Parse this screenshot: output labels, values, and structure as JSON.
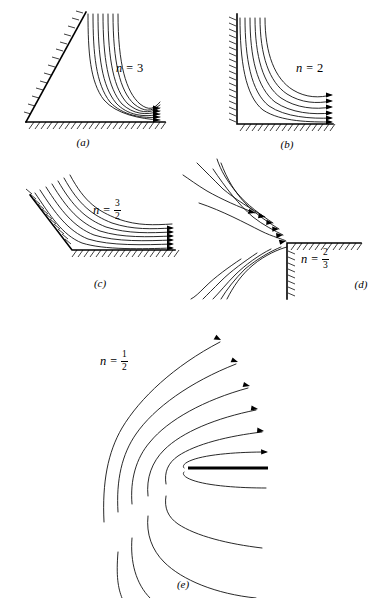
{
  "figure": {
    "background_color": "#ffffff",
    "ink_color": "#000000",
    "panels": [
      {
        "id": "a",
        "caption": "(a)",
        "label": {
          "variable": "n",
          "equals": "=",
          "value": "3",
          "is_fraction": false,
          "numerator": "",
          "denominator": ""
        },
        "wall_type": "acute-wedge",
        "corner_angle_deg": 60,
        "streamline_count": 7,
        "arrow_count": 5,
        "flow_direction": "right"
      },
      {
        "id": "b",
        "caption": "(b)",
        "label": {
          "variable": "n",
          "equals": "=",
          "value": "2",
          "is_fraction": false,
          "numerator": "",
          "denominator": ""
        },
        "wall_type": "right-angle-corner",
        "corner_angle_deg": 90,
        "streamline_count": 6,
        "arrow_count": 6,
        "flow_direction": "right"
      },
      {
        "id": "c",
        "caption": "(c)",
        "label": {
          "variable": "n",
          "equals": "=",
          "value": "",
          "is_fraction": true,
          "numerator": "3",
          "denominator": "2"
        },
        "wall_type": "obtuse-corner",
        "corner_angle_deg": 120,
        "streamline_count": 7,
        "arrow_count": 6,
        "flow_direction": "right"
      },
      {
        "id": "d",
        "caption": "(d)",
        "label": {
          "variable": "n",
          "equals": "=",
          "value": "",
          "is_fraction": true,
          "numerator": "2",
          "denominator": "3"
        },
        "wall_type": "exterior-corner",
        "corner_angle_deg": 270,
        "streamline_count": 6,
        "arrow_count": 6,
        "flow_direction": "upper-right"
      },
      {
        "id": "e",
        "caption": "(e)",
        "label": {
          "variable": "n",
          "equals": "=",
          "value": "",
          "is_fraction": true,
          "numerator": "1",
          "denominator": "2"
        },
        "wall_type": "flat-plate-edge",
        "corner_angle_deg": 360,
        "streamline_count": 11,
        "arrow_count": 6,
        "flow_direction": "right-and-around"
      }
    ]
  }
}
